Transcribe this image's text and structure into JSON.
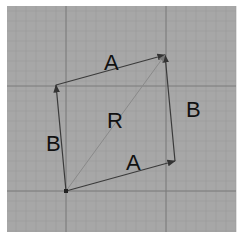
{
  "diagram": {
    "title": "",
    "type": "vector-parallelogram",
    "colors": {
      "background": "#ffffff",
      "panel": "#a7a7a7",
      "grid_minor": "#9c9c9c",
      "grid_major": "#7a7a7a",
      "vector": "#3a3a3a",
      "resultant": "#8a8a8a",
      "text": "#111111"
    },
    "panel": {
      "x": 7,
      "y": 6,
      "width": 229,
      "height": 226
    },
    "grid": {
      "minor_step": 10,
      "major_x": [
        66,
        166
      ],
      "major_y": [
        86,
        191
      ]
    },
    "points": {
      "O": {
        "x": 66,
        "y": 191
      },
      "A_end": {
        "x": 175,
        "y": 161
      },
      "B_end": {
        "x": 56,
        "y": 85
      },
      "R_end": {
        "x": 165,
        "y": 55
      }
    },
    "vectors": [
      {
        "id": "A_bottom",
        "label": "A",
        "from": "O",
        "to": "A_end"
      },
      {
        "id": "B_left",
        "label": "B",
        "from": "O",
        "to": "B_end"
      },
      {
        "id": "A_top",
        "label": "A",
        "from": "B_end",
        "to": "R_end"
      },
      {
        "id": "B_right",
        "label": "B",
        "from": "A_end",
        "to": "R_end"
      },
      {
        "id": "R",
        "label": "R",
        "from": "O",
        "to": "R_end"
      }
    ],
    "labels": [
      {
        "id": "label-a-top",
        "text": "A",
        "x": 104,
        "y": 70
      },
      {
        "id": "label-b-left",
        "text": "B",
        "x": 46,
        "y": 151
      },
      {
        "id": "label-r",
        "text": "R",
        "x": 107,
        "y": 128
      },
      {
        "id": "label-b-right",
        "text": "B",
        "x": 186,
        "y": 117
      },
      {
        "id": "label-a-bottom",
        "text": "A",
        "x": 126,
        "y": 170
      }
    ]
  }
}
